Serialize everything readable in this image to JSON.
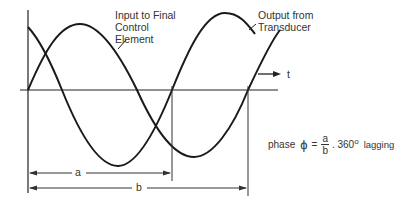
{
  "labels": {
    "input_line1": "Input to Final",
    "input_line2": "Control",
    "input_line3": "Element",
    "output_line1": "Output from",
    "output_line2": "Transducer",
    "time_axis": "t",
    "dim_a": "a",
    "dim_b": "b"
  },
  "formula": {
    "prefix": "phase",
    "symbol": "ϕ",
    "equals": "=",
    "numerator": "a",
    "denominator": "b",
    "multiplier": ". 360",
    "degree": "o",
    "suffix": "lagging"
  },
  "colors": {
    "stroke": "#1a1a1a",
    "text": "#333333"
  }
}
